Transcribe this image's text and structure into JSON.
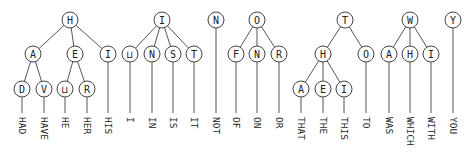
{
  "diagram": {
    "node_radius": 8,
    "word_top_y": 117,
    "colors": {
      "edge": "#555555",
      "node_stroke": "#444444",
      "text": "#222222",
      "background": "#ffffff"
    },
    "nodes": [
      {
        "id": "h",
        "label": "H",
        "x": 70,
        "y": 20
      },
      {
        "id": "ha",
        "label": "A",
        "x": 33,
        "y": 54
      },
      {
        "id": "he",
        "label": "E",
        "x": 75,
        "y": 54
      },
      {
        "id": "hi",
        "label": "I",
        "x": 108,
        "y": 54
      },
      {
        "id": "had",
        "label": "D",
        "x": 22,
        "y": 89
      },
      {
        "id": "hav",
        "label": "V",
        "x": 44,
        "y": 89
      },
      {
        "id": "he_",
        "label": "⊔",
        "x": 65,
        "y": 89
      },
      {
        "id": "her",
        "label": "R",
        "x": 87,
        "y": 89
      },
      {
        "id": "i",
        "label": "I",
        "x": 162,
        "y": 20
      },
      {
        "id": "i_",
        "label": "⊔",
        "x": 130,
        "y": 54
      },
      {
        "id": "in",
        "label": "N",
        "x": 152,
        "y": 54
      },
      {
        "id": "is",
        "label": "S",
        "x": 173,
        "y": 54
      },
      {
        "id": "it",
        "label": "T",
        "x": 194,
        "y": 54
      },
      {
        "id": "n",
        "label": "N",
        "x": 216,
        "y": 20
      },
      {
        "id": "o",
        "label": "O",
        "x": 257,
        "y": 20
      },
      {
        "id": "of",
        "label": "F",
        "x": 236,
        "y": 54
      },
      {
        "id": "on",
        "label": "N",
        "x": 257,
        "y": 54
      },
      {
        "id": "or",
        "label": "R",
        "x": 279,
        "y": 54
      },
      {
        "id": "t",
        "label": "T",
        "x": 345,
        "y": 20
      },
      {
        "id": "th",
        "label": "H",
        "x": 323,
        "y": 54
      },
      {
        "id": "to",
        "label": "O",
        "x": 366,
        "y": 54
      },
      {
        "id": "tha",
        "label": "A",
        "x": 301,
        "y": 89
      },
      {
        "id": "the",
        "label": "E",
        "x": 323,
        "y": 89
      },
      {
        "id": "thi",
        "label": "I",
        "x": 344,
        "y": 89
      },
      {
        "id": "w",
        "label": "W",
        "x": 410,
        "y": 20
      },
      {
        "id": "wa",
        "label": "A",
        "x": 389,
        "y": 54
      },
      {
        "id": "wh",
        "label": "H",
        "x": 410,
        "y": 54
      },
      {
        "id": "wi",
        "label": "I",
        "x": 431,
        "y": 54
      },
      {
        "id": "y",
        "label": "Y",
        "x": 453,
        "y": 20
      }
    ],
    "edges": [
      [
        "h",
        "ha"
      ],
      [
        "h",
        "he"
      ],
      [
        "h",
        "hi"
      ],
      [
        "ha",
        "had"
      ],
      [
        "ha",
        "hav"
      ],
      [
        "he",
        "he_"
      ],
      [
        "he",
        "her"
      ],
      [
        "i",
        "i_"
      ],
      [
        "i",
        "in"
      ],
      [
        "i",
        "is"
      ],
      [
        "i",
        "it"
      ],
      [
        "o",
        "of"
      ],
      [
        "o",
        "on"
      ],
      [
        "o",
        "or"
      ],
      [
        "t",
        "th"
      ],
      [
        "t",
        "to"
      ],
      [
        "th",
        "tha"
      ],
      [
        "th",
        "the"
      ],
      [
        "th",
        "thi"
      ],
      [
        "w",
        "wa"
      ],
      [
        "w",
        "wh"
      ],
      [
        "w",
        "wi"
      ]
    ],
    "leaves": [
      {
        "node": "had",
        "word": "HAD"
      },
      {
        "node": "hav",
        "word": "HAVE"
      },
      {
        "node": "he_",
        "word": "HE"
      },
      {
        "node": "her",
        "word": "HER"
      },
      {
        "node": "hi",
        "word": "HIS"
      },
      {
        "node": "i_",
        "word": "I"
      },
      {
        "node": "in",
        "word": "IN"
      },
      {
        "node": "is",
        "word": "IS"
      },
      {
        "node": "it",
        "word": "IT"
      },
      {
        "node": "n",
        "word": "NOT"
      },
      {
        "node": "of",
        "word": "OF"
      },
      {
        "node": "on",
        "word": "ON"
      },
      {
        "node": "or",
        "word": "OR"
      },
      {
        "node": "tha",
        "word": "THAT"
      },
      {
        "node": "the",
        "word": "THE"
      },
      {
        "node": "thi",
        "word": "THIS"
      },
      {
        "node": "to",
        "word": "TO"
      },
      {
        "node": "wa",
        "word": "WAS"
      },
      {
        "node": "wh",
        "word": "WHICH"
      },
      {
        "node": "wi",
        "word": "WITH"
      },
      {
        "node": "y",
        "word": "YOU"
      }
    ]
  }
}
